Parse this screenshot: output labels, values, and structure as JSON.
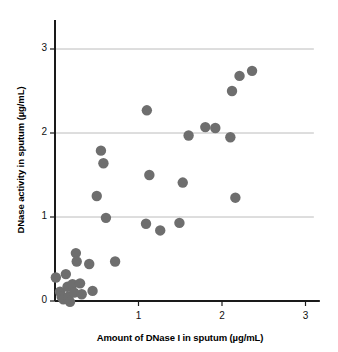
{
  "chart_data": {
    "type": "scatter",
    "title": "",
    "xlabel": "Amount of DNase I in sputum (µg/mL)",
    "ylabel": "DNase activity in sputum (µg/mL)",
    "xlim": [
      0,
      3.1
    ],
    "ylim": [
      0,
      3.25
    ],
    "xticks": [
      1,
      2,
      3
    ],
    "yticks": [
      0,
      1,
      2,
      3
    ],
    "xtick_labels": [
      "1",
      "2",
      "3"
    ],
    "ytick_labels": [
      "0",
      "1",
      "2",
      "3"
    ],
    "grid": "horizontal",
    "grid_values": [
      1,
      2,
      3
    ],
    "legend": "none",
    "marker": "filled-circle",
    "marker_color": "#6e6e6e",
    "marker_size": 5.2,
    "axis_color": "#1a1a1a",
    "grid_color": "#b4b4b4",
    "points": [
      {
        "x": 0.01,
        "y": 0.28
      },
      {
        "x": 0.06,
        "y": 0.11
      },
      {
        "x": 0.08,
        "y": 0.05
      },
      {
        "x": 0.1,
        "y": 0.02
      },
      {
        "x": 0.13,
        "y": 0.32
      },
      {
        "x": 0.15,
        "y": 0.17
      },
      {
        "x": 0.16,
        "y": 0.05
      },
      {
        "x": 0.18,
        "y": -0.01
      },
      {
        "x": 0.21,
        "y": 0.2
      },
      {
        "x": 0.23,
        "y": 0.1
      },
      {
        "x": 0.25,
        "y": 0.57
      },
      {
        "x": 0.26,
        "y": 0.47
      },
      {
        "x": 0.3,
        "y": 0.21
      },
      {
        "x": 0.32,
        "y": 0.08
      },
      {
        "x": 0.41,
        "y": 0.44
      },
      {
        "x": 0.45,
        "y": 0.12
      },
      {
        "x": 0.5,
        "y": 1.25
      },
      {
        "x": 0.55,
        "y": 1.79
      },
      {
        "x": 0.58,
        "y": 1.64
      },
      {
        "x": 0.61,
        "y": 0.99
      },
      {
        "x": 0.72,
        "y": 0.47
      },
      {
        "x": 1.09,
        "y": 0.92
      },
      {
        "x": 1.1,
        "y": 2.27
      },
      {
        "x": 1.13,
        "y": 1.5
      },
      {
        "x": 1.26,
        "y": 0.84
      },
      {
        "x": 1.49,
        "y": 0.93
      },
      {
        "x": 1.53,
        "y": 1.41
      },
      {
        "x": 1.6,
        "y": 1.97
      },
      {
        "x": 1.8,
        "y": 2.07
      },
      {
        "x": 1.92,
        "y": 2.06
      },
      {
        "x": 2.1,
        "y": 1.95
      },
      {
        "x": 2.12,
        "y": 2.5
      },
      {
        "x": 2.16,
        "y": 1.23
      },
      {
        "x": 2.21,
        "y": 2.68
      },
      {
        "x": 2.36,
        "y": 2.74
      }
    ]
  }
}
